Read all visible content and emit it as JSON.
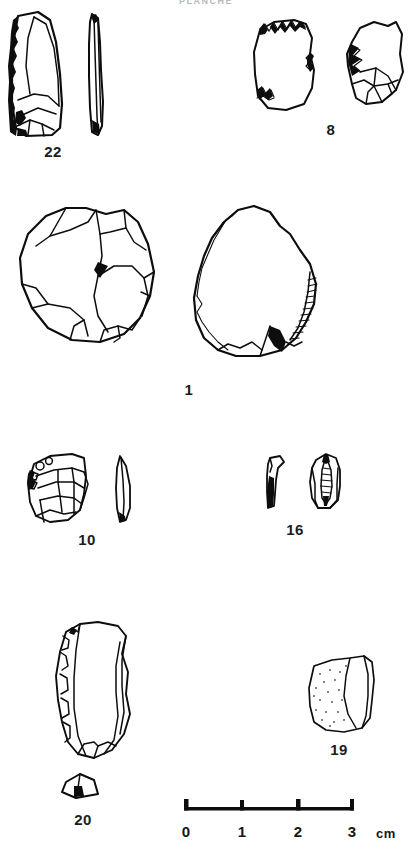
{
  "plate": {
    "title": "PLANCHE",
    "background_color": "#ffffff",
    "ink_color": "#0d0d0d",
    "width": 412,
    "height": 849
  },
  "figures": [
    {
      "label": "22",
      "description": "retouched blade, face view and profile view",
      "views": 2
    },
    {
      "label": "8",
      "description": "flake with denticulate retouch, two views",
      "views": 2
    },
    {
      "label": "1",
      "description": "large core and large rounded flake with retouched edge",
      "views": 2
    },
    {
      "label": "10",
      "description": "flake face view with lenticular profile",
      "views": 2
    },
    {
      "label": "16",
      "description": "small bladelet profile and face view",
      "views": 2
    },
    {
      "label": "20",
      "description": "elongated flake with scalloped retouch and small section",
      "views": 2
    },
    {
      "label": "19",
      "description": "flake with cortical stippled surface",
      "views": 1
    }
  ],
  "scale": {
    "ticks": [
      "0",
      "1",
      "2",
      "3"
    ],
    "unit": "cm",
    "divisions": 3
  }
}
